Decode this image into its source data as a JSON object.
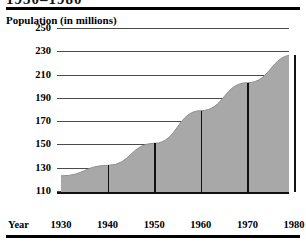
{
  "header": {
    "clipped_title": "1930–1980",
    "top_rule_color": "#000000",
    "bottom_rule_color": "#000000"
  },
  "chart_data": {
    "type": "area",
    "title": "1930–1980",
    "subtitle": "",
    "ylabel": "Population (in millions)",
    "xlabel": "Year",
    "categories": [
      "1930",
      "1940",
      "1950",
      "1960",
      "1970",
      "1980"
    ],
    "x": [
      1930,
      1940,
      1950,
      1960,
      1970,
      1980
    ],
    "values": [
      123,
      132,
      151,
      179,
      203,
      227
    ],
    "series": [
      {
        "name": "Population",
        "values": [
          123,
          132,
          151,
          179,
          203,
          227
        ]
      }
    ],
    "yticks": [
      110,
      130,
      150,
      170,
      190,
      210,
      230,
      250
    ],
    "ylim": [
      103,
      258
    ],
    "xlim": [
      1930,
      1985
    ],
    "grid": true,
    "legend": false,
    "legend_position": "none",
    "fill_color": "#a8a8a8",
    "grid_color": "#4a4a4a",
    "axis_color": "#111111"
  },
  "labels": {
    "y_axis_title": "Population (in millions)",
    "x_axis_name": "Year",
    "yticks": [
      "250",
      "230",
      "210",
      "190",
      "170",
      "150",
      "130",
      "110"
    ],
    "xticks": [
      "1930",
      "1940",
      "1950",
      "1960",
      "1970",
      "1980"
    ]
  }
}
